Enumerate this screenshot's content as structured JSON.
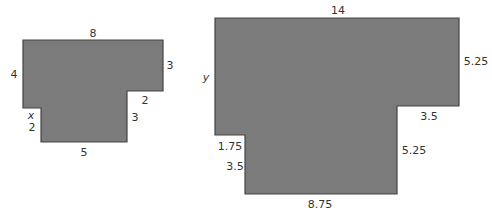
{
  "colors": {
    "fill": "#7b7b7b",
    "stroke": "#444444",
    "text": "#333333"
  },
  "small_figure": {
    "labels": {
      "top": "8",
      "left": "4",
      "right_upper": "3",
      "step_horizontal": "2",
      "right_lower": "3",
      "notch_horizontal": "x",
      "notch_vertical": "2",
      "bottom": "5"
    }
  },
  "large_figure": {
    "labels": {
      "top": "14",
      "left": "y",
      "right_upper": "5.25",
      "step_horizontal": "3.5",
      "right_lower": "5.25",
      "notch_horizontal": "1.75",
      "notch_vertical": "3.5",
      "bottom": "8.75"
    }
  }
}
